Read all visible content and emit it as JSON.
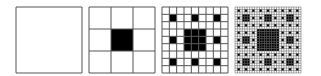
{
  "figure": {
    "background": "#ffffff",
    "line_color": "#555555",
    "fill_color": "#000000",
    "panels": [
      {
        "level": 0,
        "left": 15
      },
      {
        "level": 1,
        "left": 88
      },
      {
        "level": 2,
        "left": 161
      },
      {
        "level": 3,
        "left": 234
      }
    ]
  }
}
